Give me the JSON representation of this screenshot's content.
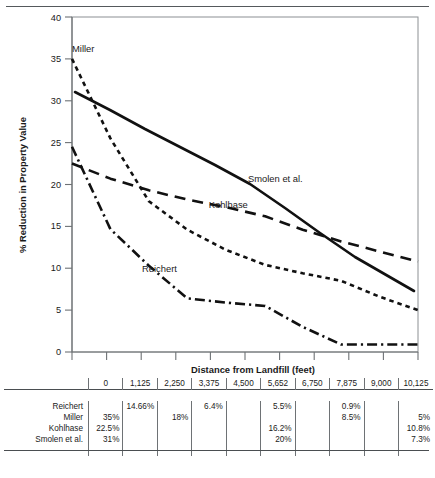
{
  "chart_data": {
    "type": "line",
    "title": "",
    "xlabel": "Distance from Landfill (feet)",
    "ylabel": "% Reduction in Property Value",
    "xlim": [
      0,
      10125
    ],
    "ylim": [
      0,
      40
    ],
    "yticks": [
      0,
      5,
      10,
      15,
      20,
      25,
      30,
      35,
      40
    ],
    "xticks": [
      0,
      1125,
      2250,
      3375,
      4500,
      5652,
      6750,
      7875,
      9000,
      10125
    ],
    "grid": false,
    "legend_position": "inline-annotations",
    "series": [
      {
        "name": "Miller",
        "style": "dashed",
        "label": "Miller",
        "x": [
          0,
          1125,
          2250,
          3375,
          4500,
          5652,
          6750,
          7875,
          9000,
          10125
        ],
        "y": [
          35,
          25.5,
          18,
          14.6,
          12.2,
          10.4,
          9.4,
          8.5,
          6.6,
          5
        ]
      },
      {
        "name": "Kohlhase",
        "style": "long-dashed",
        "label": "Kohlhase",
        "x": [
          0,
          1125,
          2250,
          3375,
          4500,
          5652,
          6750,
          7875,
          9000,
          10125
        ],
        "y": [
          22.5,
          20.7,
          19.3,
          18.2,
          17.3,
          16.2,
          14.6,
          13.2,
          12.0,
          10.8
        ]
      },
      {
        "name": "Smolen et al.",
        "style": "solid",
        "label": "Smolen et al.",
        "x": [
          0,
          1125,
          2250,
          3375,
          4500,
          5652,
          6750,
          7875,
          9000,
          10125
        ],
        "y": [
          31,
          28.8,
          26.6,
          24.4,
          22.3,
          20,
          17.2,
          14.2,
          11.3,
          7.3
        ]
      },
      {
        "name": "Reichert",
        "style": "dash-dot",
        "label": "Reichert",
        "x": [
          0,
          1125,
          2250,
          3375,
          4500,
          5652,
          6750,
          7875,
          9000,
          10125
        ],
        "y": [
          24.5,
          14.66,
          10.3,
          6.4,
          5.9,
          5.5,
          3.0,
          0.9,
          0.9,
          0.9
        ]
      }
    ],
    "annotations": [
      {
        "text": "Miller",
        "x": 0.13,
        "y": 35.8
      },
      {
        "text": "Smolen et al.",
        "x": 5100,
        "y": 21.5
      },
      {
        "text": "Kohlhase",
        "x": 4000,
        "y": 17.2
      },
      {
        "text": "Reichert",
        "x": 2050,
        "y": 9.6
      }
    ]
  },
  "table": {
    "corner_label": "",
    "columns": [
      "0",
      "1,125",
      "2,250",
      "3,375",
      "4,500",
      "5,652",
      "6,750",
      "7,875",
      "9,000",
      "10,125"
    ],
    "rows": [
      {
        "label": "Reichert",
        "cells": [
          "",
          "14.66%",
          "",
          "6.4%",
          "",
          "5.5%",
          "",
          "0.9%",
          "",
          ""
        ]
      },
      {
        "label": "Miller",
        "cells": [
          "35%",
          "",
          "18%",
          "",
          "",
          "",
          "",
          "8.5%",
          "",
          "5%"
        ]
      },
      {
        "label": "Kohlhase",
        "cells": [
          "22.5%",
          "",
          "",
          "",
          "",
          "16.2%",
          "",
          "",
          "",
          "10.8%"
        ]
      },
      {
        "label": "Smolen et al.",
        "cells": [
          "31%",
          "",
          "",
          "",
          "",
          "20%",
          "",
          "",
          "",
          "7.3%"
        ]
      }
    ]
  },
  "colors": {
    "ink": "#1a1a1a",
    "rule": "#4a4e51",
    "axis": "#6e7275"
  }
}
